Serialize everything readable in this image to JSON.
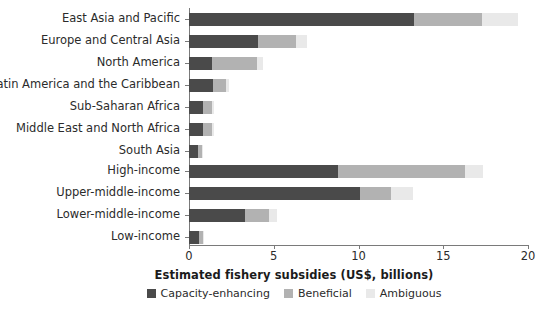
{
  "chart_data": {
    "type": "bar",
    "orientation": "horizontal",
    "stacked": true,
    "title": "",
    "xlabel": "Estimated fishery subsidies (US$, billions)",
    "ylabel": "",
    "xlim": [
      0,
      20
    ],
    "xticks": [
      0,
      5,
      10,
      15,
      20
    ],
    "xticklabels": [
      "0",
      "5",
      "10",
      "15",
      "20"
    ],
    "grid": false,
    "legend_position": "bottom",
    "series": [
      {
        "name": "Capacity-enhancing",
        "color": "#4a4a4a",
        "values": [
          13.3,
          4.1,
          1.35,
          1.4,
          0.85,
          0.85,
          0.55,
          8.8,
          10.1,
          3.3,
          0.6
        ]
      },
      {
        "name": "Beneficial",
        "color": "#b2b2b2",
        "values": [
          4.0,
          2.2,
          2.65,
          0.8,
          0.5,
          0.5,
          0.2,
          7.5,
          1.8,
          1.4,
          0.2
        ]
      },
      {
        "name": "Ambiguous",
        "color": "#e9e9e9",
        "values": [
          2.1,
          0.65,
          0.35,
          0.15,
          0.1,
          0.1,
          0.05,
          1.05,
          1.3,
          0.5,
          0.1
        ]
      }
    ],
    "groups": [
      {
        "name": "regions",
        "categories": [
          "East Asia and Pacific",
          "Europe and Central Asia",
          "North America",
          "Latin America and the Caribbean",
          "Sub-Saharan Africa",
          "Middle East and North Africa",
          "South Asia"
        ]
      },
      {
        "name": "income",
        "categories": [
          "High-income",
          "Upper-middle-income",
          "Lower-middle-income",
          "Low-income"
        ]
      }
    ],
    "categories": [
      "East Asia and Pacific",
      "Europe and Central Asia",
      "North America",
      "Latin America and the Caribbean",
      "Sub-Saharan Africa",
      "Middle East and North Africa",
      "South Asia",
      "High-income",
      "Upper-middle-income",
      "Lower-middle-income",
      "Low-income"
    ]
  },
  "legend": {
    "items": [
      {
        "label": "Capacity-enhancing",
        "swatch": "cap"
      },
      {
        "label": "Beneficial",
        "swatch": "ben"
      },
      {
        "label": "Ambiguous",
        "swatch": "amb"
      }
    ]
  },
  "colors": {
    "capacity_enhancing": "#4a4a4a",
    "beneficial": "#b2b2b2",
    "ambiguous": "#e9e9e9",
    "axis": "#7a7a7a",
    "text": "#2b2b2b",
    "background": "#ffffff"
  }
}
